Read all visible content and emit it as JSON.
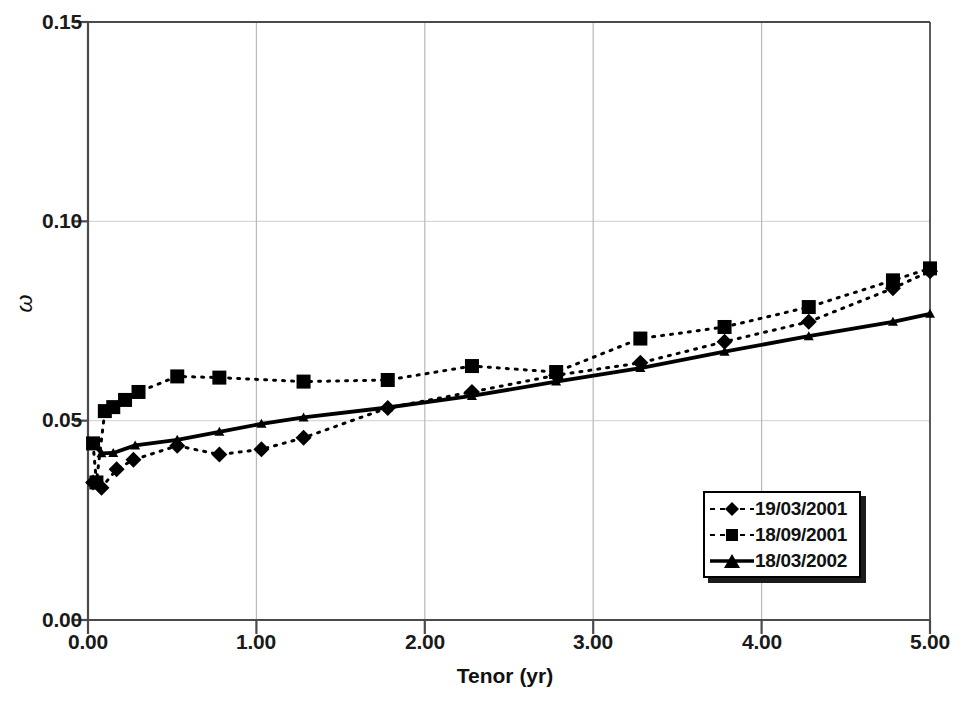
{
  "chart_data": {
    "type": "line",
    "title": "",
    "xlabel": "Tenor (yr)",
    "ylabel": "ω",
    "xlim": [
      0.0,
      5.0
    ],
    "ylim": [
      0.0,
      0.15
    ],
    "xticks": [
      "0.00",
      "1.00",
      "2.00",
      "3.00",
      "4.00",
      "5.00"
    ],
    "yticks": [
      "0.00",
      "0.05",
      "0.10",
      "0.15"
    ],
    "xtick_values": [
      0.0,
      1.0,
      2.0,
      3.0,
      4.0,
      5.0
    ],
    "ytick_values": [
      0.0,
      0.05,
      0.1,
      0.15
    ],
    "grid": "both-major",
    "legend_position": "lower-right-inside",
    "series": [
      {
        "name": "19/03/2001",
        "marker": "diamond",
        "linestyle": "dashed",
        "color": "#000000",
        "x": [
          0.03,
          0.08,
          0.17,
          0.27,
          0.53,
          0.78,
          1.03,
          1.28,
          1.78,
          2.28,
          2.78,
          3.28,
          3.78,
          4.28,
          4.78,
          5.0
        ],
        "y": [
          0.0345,
          0.0332,
          0.0378,
          0.0402,
          0.0437,
          0.0415,
          0.0428,
          0.0457,
          0.0532,
          0.0572,
          0.0614,
          0.0645,
          0.0698,
          0.0748,
          0.0832,
          0.0875
        ]
      },
      {
        "name": "18/09/2001",
        "marker": "square",
        "linestyle": "dashed",
        "color": "#000000",
        "x": [
          0.03,
          0.05,
          0.1,
          0.15,
          0.22,
          0.3,
          0.53,
          0.78,
          1.28,
          1.78,
          2.28,
          2.78,
          3.28,
          3.78,
          4.28,
          4.78,
          5.0
        ],
        "y": [
          0.0443,
          0.0345,
          0.0524,
          0.0534,
          0.0552,
          0.0572,
          0.0611,
          0.0608,
          0.0598,
          0.0602,
          0.0637,
          0.0622,
          0.0706,
          0.0735,
          0.0785,
          0.0852,
          0.0882
        ]
      },
      {
        "name": "18/03/2002",
        "marker": "triangle",
        "linestyle": "solid",
        "color": "#000000",
        "x": [
          0.03,
          0.08,
          0.15,
          0.28,
          0.53,
          0.78,
          1.03,
          1.28,
          1.78,
          2.28,
          2.78,
          3.28,
          3.78,
          4.28,
          4.78,
          5.0
        ],
        "y": [
          0.0443,
          0.0418,
          0.0419,
          0.0438,
          0.0452,
          0.0472,
          0.0492,
          0.0508,
          0.0533,
          0.0562,
          0.0598,
          0.0632,
          0.0673,
          0.0712,
          0.0748,
          0.0768
        ]
      }
    ]
  },
  "axes": {
    "x_title": "Tenor (yr)",
    "y_title": "ω",
    "x_labels": [
      "0.00",
      "1.00",
      "2.00",
      "3.00",
      "4.00",
      "5.00"
    ],
    "y_labels": [
      "0.00",
      "0.05",
      "0.10",
      "0.15"
    ]
  },
  "legend": {
    "items": [
      {
        "label": "19/03/2001",
        "marker": "diamond-marker",
        "style": "dashed"
      },
      {
        "label": "18/09/2001",
        "marker": "square-marker",
        "style": "dashed"
      },
      {
        "label": "18/03/2002",
        "marker": "triangle-marker",
        "style": "solid"
      }
    ]
  },
  "colors": {
    "ink": "#000000",
    "axis": "#4a4a4a",
    "grid_horizontal": "#d8d8d8",
    "grid_vertical": "#b8b8b8",
    "background": "#ffffff"
  }
}
